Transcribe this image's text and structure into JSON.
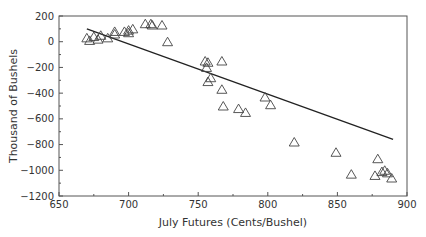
{
  "chart_data": {
    "type": "scatter",
    "title": "",
    "xlabel": "July Futures (Cents/Bushel)",
    "ylabel": "Thousand of Bushels",
    "xlim": [
      650,
      900
    ],
    "ylim": [
      -1200,
      200
    ],
    "xticks": [
      650,
      700,
      750,
      800,
      850,
      900
    ],
    "yticks": [
      200,
      0,
      -200,
      -400,
      -600,
      -800,
      -1000,
      -1200
    ],
    "xtick_labels": [
      "650",
      "700",
      "750",
      "800",
      "850",
      "900"
    ],
    "ytick_labels": [
      "200",
      "0",
      "−200",
      "−400",
      "−600",
      "−800",
      "−1000",
      "−1200"
    ],
    "grid": false,
    "legend": null,
    "series": [
      {
        "name": "observations",
        "marker": "triangle-open",
        "points": [
          [
            670,
            30
          ],
          [
            672,
            10
          ],
          [
            675,
            40
          ],
          [
            678,
            20
          ],
          [
            680,
            50
          ],
          [
            685,
            30
          ],
          [
            690,
            80
          ],
          [
            690,
            60
          ],
          [
            697,
            80
          ],
          [
            700,
            90
          ],
          [
            700,
            70
          ],
          [
            703,
            100
          ],
          [
            712,
            140
          ],
          [
            716,
            140
          ],
          [
            717,
            130
          ],
          [
            724,
            130
          ],
          [
            728,
            0
          ],
          [
            755,
            -150
          ],
          [
            757,
            -160
          ],
          [
            756,
            -200
          ],
          [
            757,
            -310
          ],
          [
            759,
            -280
          ],
          [
            767,
            -150
          ],
          [
            767,
            -370
          ],
          [
            768,
            -500
          ],
          [
            779,
            -520
          ],
          [
            784,
            -550
          ],
          [
            798,
            -430
          ],
          [
            802,
            -490
          ],
          [
            819,
            -780
          ],
          [
            849,
            -860
          ],
          [
            860,
            -1030
          ],
          [
            877,
            -1040
          ],
          [
            879,
            -910
          ],
          [
            882,
            -1010
          ],
          [
            884,
            -1000
          ],
          [
            886,
            -1020
          ],
          [
            889,
            -1060
          ]
        ]
      },
      {
        "name": "regression line",
        "type": "line",
        "points": [
          [
            670,
            100
          ],
          [
            890,
            -760
          ]
        ]
      }
    ]
  },
  "colors": {
    "axis": "#555555",
    "marker": "#444444",
    "line": "#222222",
    "text": "#333333"
  }
}
